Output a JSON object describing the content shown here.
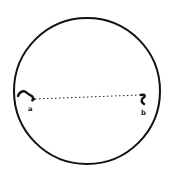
{
  "diagram": {
    "shape": "circle",
    "stroke_color": "#111111",
    "background": "#ffffff",
    "points": [
      {
        "id": "a",
        "label": "a",
        "marker": "squiggle"
      },
      {
        "id": "b",
        "label": "b",
        "marker": "squiggle"
      }
    ],
    "connector": {
      "style": "dotted",
      "from": "a",
      "to": "b"
    }
  }
}
